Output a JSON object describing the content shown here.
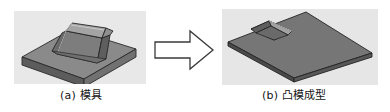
{
  "figure": {
    "type": "technical-illustration",
    "background": "#ffffff",
    "panels": [
      {
        "id": "a",
        "caption_label": "(a)",
        "caption_text": "模具",
        "caption_full": "(a) 模具",
        "background": "#e8e8e8",
        "object": "square base plate with trapezoidal boss (punch/mold)",
        "colors": {
          "plate_top": "#8c8c8c",
          "plate_front": "#5a5a5a",
          "plate_side": "#6e6e6e",
          "boss_top": "#a6a6a6",
          "boss_front": "#787878",
          "boss_side": "#5e5e5e",
          "outline": "#2a2a2a"
        }
      },
      {
        "id": "b",
        "caption_label": "(b)",
        "caption_text": "凸模成型",
        "caption_full": "(b) 凸模成型",
        "background": "#e6e6e6",
        "object": "flat sheet plate with rectangular formed indentation",
        "colors": {
          "sheet_top": "#767676",
          "sheet_edge": "#4a4a4a",
          "pocket_shadow": "#3c3c3c",
          "pocket_wall": "#9a9a9a",
          "outline": "#242424"
        }
      }
    ],
    "arrow": {
      "name": "block-arrow-right",
      "direction": "right",
      "fill": "#ffffff",
      "stroke": "#3a3a3a",
      "stroke_width": 1.3
    }
  }
}
